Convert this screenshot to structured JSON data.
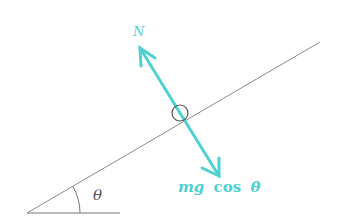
{
  "diagram": {
    "labels": {
      "normal_force": "N",
      "gravity_component": "mg cos θ",
      "gravity_mg": "mg",
      "gravity_cos": "cos",
      "gravity_theta": "θ",
      "angle": "θ"
    },
    "colors": {
      "force_arrows": "#4fd1d1",
      "incline": "#888888",
      "block": "#555555",
      "background": "#ffffff"
    },
    "geometry": {
      "incline_start": [
        27,
        213
      ],
      "incline_end": [
        320,
        42
      ],
      "base_end": [
        120,
        213
      ],
      "block_center": [
        180,
        113
      ],
      "block_radius": 8,
      "normal_arrow": {
        "from": [
          180,
          113
        ],
        "to": [
          140,
          48
        ]
      },
      "gravity_arrow": {
        "from": [
          180,
          113
        ],
        "to": [
          219,
          176
        ]
      }
    }
  }
}
